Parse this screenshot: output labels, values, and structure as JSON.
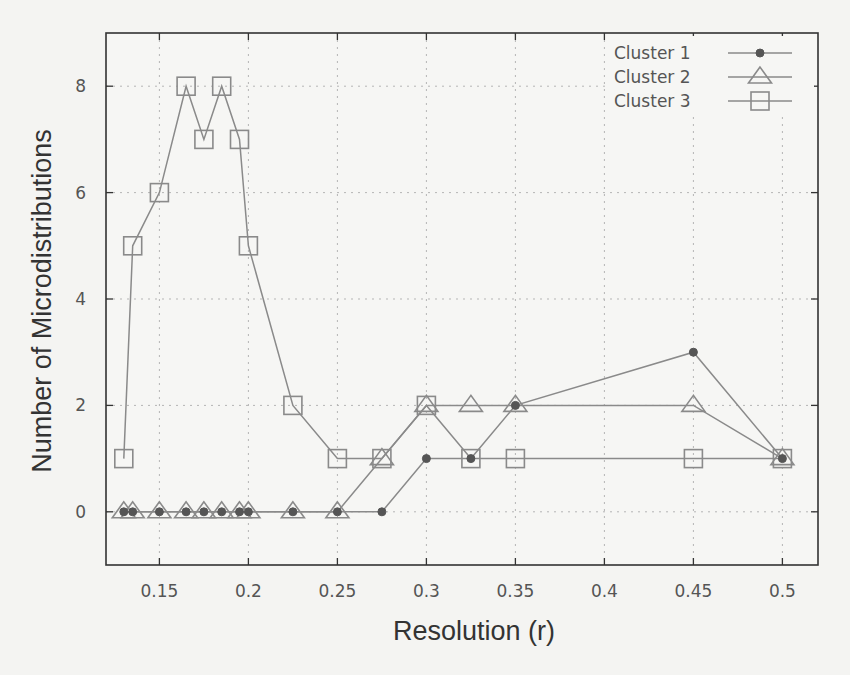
{
  "chart_data": {
    "type": "line",
    "title": "",
    "xlabel": "Resolution (r)",
    "ylabel": "Number of Microdistributions",
    "xlim": [
      0.12,
      0.52
    ],
    "ylim": [
      -1,
      9
    ],
    "xticks": [
      0.15,
      0.2,
      0.25,
      0.3,
      0.35,
      0.4,
      0.45,
      0.5
    ],
    "xtick_labels": [
      "0.15",
      "0.2",
      "0.25",
      "0.3",
      "0.35",
      "0.4",
      "0.45",
      "0.5"
    ],
    "yticks": [
      0,
      2,
      4,
      6,
      8
    ],
    "ytick_labels": [
      "0",
      "2",
      "4",
      "6",
      "8"
    ],
    "grid": true,
    "legend_position": "top-right",
    "x": [
      0.13,
      0.135,
      0.15,
      0.165,
      0.175,
      0.185,
      0.195,
      0.2,
      0.225,
      0.25,
      0.275,
      0.3,
      0.325,
      0.35,
      0.45,
      0.5
    ],
    "series": [
      {
        "name": "Cluster 1",
        "marker": "filled-circle",
        "values": [
          0,
          0,
          0,
          0,
          0,
          0,
          0,
          0,
          0,
          0,
          0,
          1,
          1,
          2,
          3,
          1
        ]
      },
      {
        "name": "Cluster 2",
        "marker": "open-triangle",
        "values": [
          0,
          0,
          0,
          0,
          0,
          0,
          0,
          0,
          0,
          0,
          1,
          2,
          2,
          2,
          2,
          1
        ]
      },
      {
        "name": "Cluster 3",
        "marker": "open-square",
        "values": [
          1,
          5,
          6,
          8,
          7,
          8,
          7,
          5,
          2,
          1,
          1,
          2,
          1,
          1,
          1,
          1
        ]
      }
    ]
  },
  "legend": {
    "items": [
      {
        "label": "Cluster 1"
      },
      {
        "label": "Cluster 2"
      },
      {
        "label": "Cluster 3"
      }
    ]
  },
  "colors": {
    "line": "#8a8a8a",
    "marker_fill": "#555555",
    "axis": "#333333",
    "grid": "#b5b5b5",
    "background": "#f4f4f2"
  }
}
